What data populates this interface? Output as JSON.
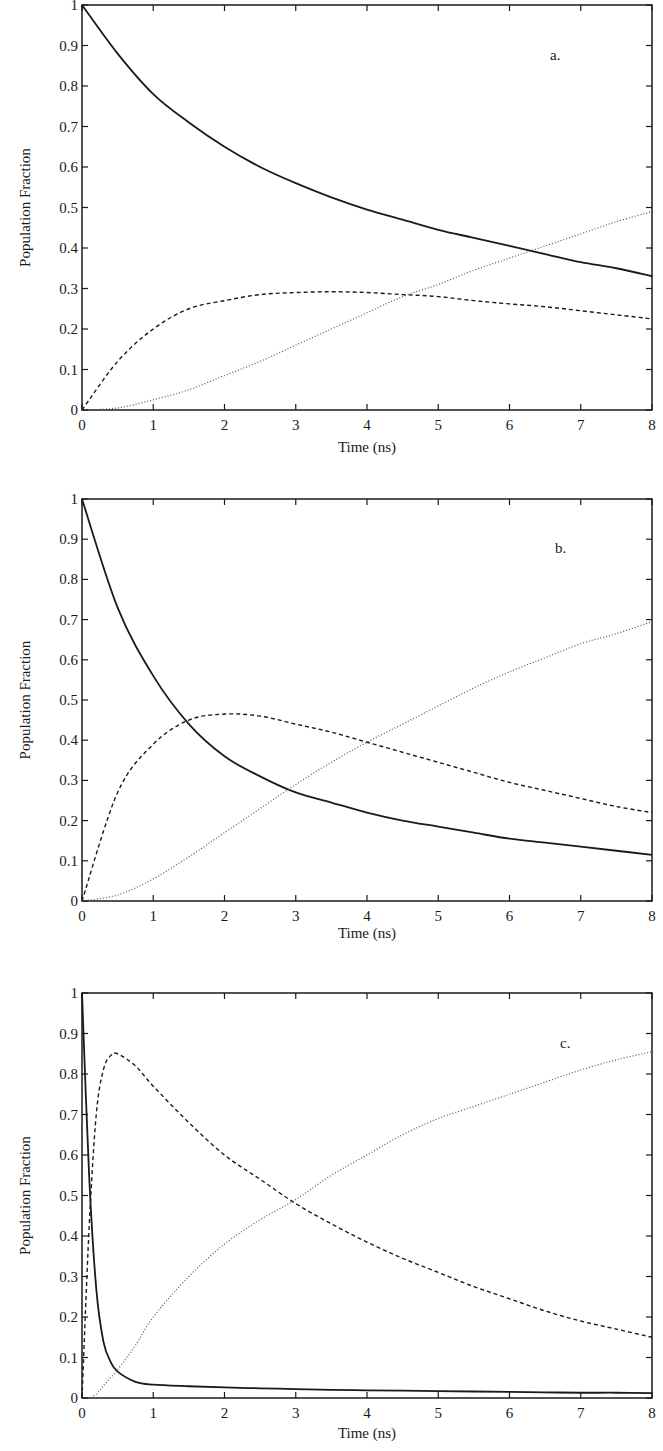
{
  "figure": {
    "panels": [
      "a.",
      "b.",
      "c."
    ]
  },
  "chart_data": [
    {
      "type": "line",
      "panel_label": "a.",
      "title": "",
      "xlabel": "Time (ns)",
      "ylabel": "Population Fraction",
      "xlim": [
        0,
        8
      ],
      "ylim": [
        0,
        1
      ],
      "x_ticks": [
        "0",
        "1",
        "2",
        "3",
        "4",
        "5",
        "6",
        "7",
        "8"
      ],
      "y_ticks": [
        "0",
        "0.1",
        "0.2",
        "0.3",
        "0.4",
        "0.5",
        "0.6",
        "0.7",
        "0.8",
        "0.9",
        "1"
      ],
      "grid": false,
      "legend": "none",
      "x": [
        0,
        0.5,
        1,
        1.5,
        2,
        2.5,
        3,
        3.5,
        4,
        4.5,
        5,
        5.5,
        6,
        6.5,
        7,
        7.5,
        8
      ],
      "series": [
        {
          "name": "solid",
          "style": "solid",
          "values": [
            1.0,
            0.88,
            0.78,
            0.71,
            0.65,
            0.6,
            0.56,
            0.525,
            0.495,
            0.47,
            0.445,
            0.425,
            0.405,
            0.385,
            0.365,
            0.35,
            0.33
          ]
        },
        {
          "name": "dashed",
          "style": "dashed",
          "values": [
            0.0,
            0.12,
            0.2,
            0.25,
            0.27,
            0.285,
            0.29,
            0.292,
            0.29,
            0.285,
            0.28,
            0.27,
            0.262,
            0.255,
            0.245,
            0.235,
            0.225
          ]
        },
        {
          "name": "dotted",
          "style": "dotted",
          "values": [
            0.0,
            0.005,
            0.025,
            0.05,
            0.085,
            0.12,
            0.16,
            0.2,
            0.24,
            0.28,
            0.31,
            0.345,
            0.375,
            0.405,
            0.435,
            0.465,
            0.49
          ]
        }
      ]
    },
    {
      "type": "line",
      "panel_label": "b.",
      "title": "",
      "xlabel": "Time (ns)",
      "ylabel": "Population Fraction",
      "xlim": [
        0,
        8
      ],
      "ylim": [
        0,
        1
      ],
      "x_ticks": [
        "0",
        "1",
        "2",
        "3",
        "4",
        "5",
        "6",
        "7",
        "8"
      ],
      "y_ticks": [
        "0",
        "0.1",
        "0.2",
        "0.3",
        "0.4",
        "0.5",
        "0.6",
        "0.7",
        "0.8",
        "0.9",
        "1"
      ],
      "grid": false,
      "legend": "none",
      "x": [
        0,
        0.5,
        1,
        1.5,
        2,
        2.5,
        3,
        3.5,
        4,
        4.5,
        5,
        5.5,
        6,
        6.5,
        7,
        7.5,
        8
      ],
      "series": [
        {
          "name": "solid",
          "style": "solid",
          "values": [
            1.0,
            0.73,
            0.56,
            0.44,
            0.36,
            0.31,
            0.27,
            0.245,
            0.22,
            0.2,
            0.185,
            0.17,
            0.155,
            0.145,
            0.135,
            0.125,
            0.115
          ]
        },
        {
          "name": "dashed",
          "style": "dashed",
          "values": [
            0.0,
            0.27,
            0.39,
            0.45,
            0.465,
            0.46,
            0.44,
            0.42,
            0.395,
            0.37,
            0.345,
            0.32,
            0.295,
            0.275,
            0.255,
            0.235,
            0.22
          ]
        },
        {
          "name": "dotted",
          "style": "dotted",
          "values": [
            0.0,
            0.015,
            0.055,
            0.11,
            0.17,
            0.23,
            0.29,
            0.345,
            0.395,
            0.44,
            0.485,
            0.53,
            0.57,
            0.605,
            0.64,
            0.665,
            0.695
          ]
        }
      ]
    },
    {
      "type": "line",
      "panel_label": "c.",
      "title": "",
      "xlabel": "Time (ns)",
      "ylabel": "Population Fraction",
      "xlim": [
        0,
        8
      ],
      "ylim": [
        0,
        1
      ],
      "x_ticks": [
        "0",
        "1",
        "2",
        "3",
        "4",
        "5",
        "6",
        "7",
        "8"
      ],
      "y_ticks": [
        "0",
        "0.1",
        "0.2",
        "0.3",
        "0.4",
        "0.5",
        "0.6",
        "0.7",
        "0.8",
        "0.9",
        "1"
      ],
      "grid": false,
      "legend": "none",
      "x": [
        0,
        0.1,
        0.2,
        0.3,
        0.4,
        0.5,
        0.75,
        1,
        1.5,
        2,
        2.5,
        3,
        3.5,
        4,
        4.5,
        5,
        5.5,
        6,
        6.5,
        7,
        7.5,
        8
      ],
      "series": [
        {
          "name": "solid",
          "style": "solid",
          "values": [
            1.0,
            0.55,
            0.27,
            0.14,
            0.09,
            0.065,
            0.04,
            0.033,
            0.029,
            0.026,
            0.024,
            0.022,
            0.02,
            0.019,
            0.018,
            0.017,
            0.016,
            0.015,
            0.014,
            0.013,
            0.013,
            0.012
          ]
        },
        {
          "name": "dashed",
          "style": "dashed",
          "values": [
            0.0,
            0.42,
            0.7,
            0.81,
            0.845,
            0.85,
            0.82,
            0.77,
            0.68,
            0.6,
            0.54,
            0.48,
            0.43,
            0.385,
            0.345,
            0.31,
            0.275,
            0.245,
            0.215,
            0.19,
            0.17,
            0.15
          ]
        },
        {
          "name": "dotted",
          "style": "dotted",
          "values": [
            0.0,
            0.0,
            0.01,
            0.03,
            0.05,
            0.07,
            0.13,
            0.2,
            0.3,
            0.38,
            0.44,
            0.49,
            0.55,
            0.6,
            0.65,
            0.69,
            0.72,
            0.75,
            0.78,
            0.81,
            0.835,
            0.855
          ]
        }
      ]
    }
  ]
}
